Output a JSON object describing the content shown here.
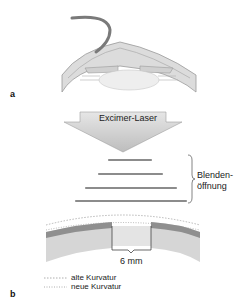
{
  "panel_a": {
    "letter": "a",
    "arrow_label": "Excimer-Laser"
  },
  "apertures": {
    "label_line1": "Blenden-",
    "label_line2": "öffnung",
    "count": 4
  },
  "panel_b": {
    "letter": "b",
    "measure_label": "6 mm",
    "legend": [
      {
        "label": "alte Kurvatur"
      },
      {
        "label": "neue Kurvatur"
      }
    ]
  },
  "colors": {
    "tissue": "#d9d9d9",
    "tissue_dark": "#a6a6a6",
    "arrow_fill": "#cfcfcf",
    "bar": "#8c8c8c",
    "tube": "#7a7a7a"
  }
}
